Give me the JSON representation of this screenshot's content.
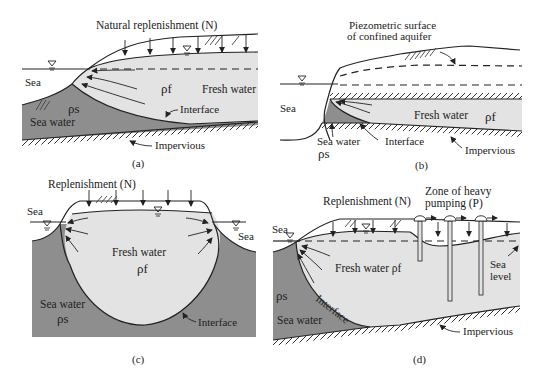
{
  "figure": "Seawater intrusion in coastal aquifers",
  "colors": {
    "fresh_water": "#e3e3e3",
    "sea_water": "#8e8e8e",
    "line": "#222222"
  },
  "panels": [
    {
      "id": "a",
      "caption": "(a)",
      "labels": {
        "replenishment": "Natural replenishment (N)",
        "sea": "Sea",
        "fresh_water": "Fresh water",
        "rho_f": "ρf",
        "sea_water": "Sea water",
        "rho_s": "ρs",
        "interface": "Interface",
        "impervious": "Impervious"
      }
    },
    {
      "id": "b",
      "caption": "(b)",
      "labels": {
        "piezometric_line1": "Piezometric surface",
        "piezometric_line2": "of confined aquifer",
        "sea": "Sea",
        "fresh_water": "Fresh water",
        "rho_f": "ρf",
        "sea_water": "Sea water",
        "rho_s": "ρs",
        "interface": "Interface",
        "impervious": "Impervious"
      }
    },
    {
      "id": "c",
      "caption": "(c)",
      "labels": {
        "replenishment": "Replenishment (N)",
        "sea_left": "Sea",
        "sea_right": "Sea",
        "fresh_water": "Fresh water",
        "rho_f": "ρf",
        "sea_water": "Sea water",
        "rho_s": "ρs",
        "interface": "Interface"
      }
    },
    {
      "id": "d",
      "caption": "(d)",
      "labels": {
        "replenishment": "Replenishment (N)",
        "pumping_line1": "Zone of heavy",
        "pumping_line2": "pumping (P)",
        "sea": "Sea",
        "fresh_water": "Fresh water ρf",
        "rho_s": "ρs",
        "sea_water": "Sea water",
        "interface": "Interface",
        "sea_level_line1": "Sea",
        "sea_level_line2": "level",
        "impervious": "Impervious"
      }
    }
  ]
}
